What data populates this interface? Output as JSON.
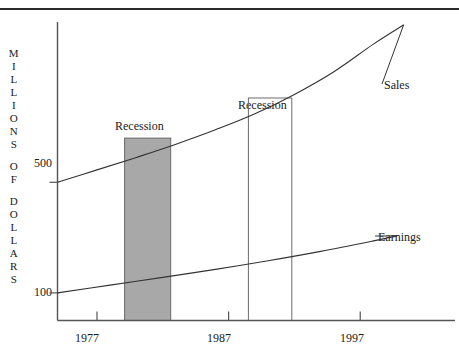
{
  "chart_data": {
    "type": "line",
    "title": "",
    "subtitle": "",
    "xlabel": "",
    "ylabel": "MILLIONS OF DOLLARS",
    "ylabel_letters": [
      "M",
      "I",
      "L",
      "L",
      "I",
      "O",
      "N",
      "S",
      "",
      "O",
      "F",
      "",
      "D",
      "O",
      "L",
      "L",
      "A",
      "R",
      "S"
    ],
    "grid": false,
    "legend_position": "inline-right-end-labels",
    "xlim": [
      1974.0,
      2004.2
    ],
    "ylim": [
      0,
      1080
    ],
    "x_ticks": [
      1977,
      1987,
      1997
    ],
    "x_tick_labels": [
      "1977",
      "1987",
      "1997"
    ],
    "y_ticks": [
      100,
      500
    ],
    "y_tick_labels": [
      "100",
      "500"
    ],
    "series": [
      {
        "name": "Sales",
        "label": "Sales",
        "color": "#333333",
        "x": [
          1974.0,
          1977.0,
          1980.0,
          1983.0,
          1986.0,
          1989.0,
          1992.0,
          1995.0,
          1998.0,
          2000.3
        ],
        "values": [
          500,
          545,
          590,
          638,
          690,
          748,
          818,
          900,
          1000,
          1070
        ]
      },
      {
        "name": "Earnings",
        "label": "Earnings",
        "color": "#333333",
        "x": [
          1974.0,
          1978.0,
          1982.0,
          1986.0,
          1990.0,
          1994.0,
          1998.0,
          1999.8
        ],
        "values": [
          100,
          128,
          156,
          185,
          216,
          250,
          288,
          306
        ]
      }
    ],
    "annotations": [
      {
        "label": "Recession",
        "kind": "shaded-band",
        "fill": "#a8a8a8",
        "stroke": "#6b6b6b",
        "x_start": 1979.1,
        "x_end": 1982.6,
        "y_top": 660,
        "y_bottom": 0
      },
      {
        "label": "Recession",
        "kind": "outline-band",
        "fill": "none",
        "stroke": "#6b6b6b",
        "x_start": 1988.5,
        "x_end": 1991.8,
        "y_top": 805,
        "y_bottom": 0
      }
    ],
    "colors": {
      "axis": "#555555",
      "line": "#333333",
      "recession_fill": "#a8a8a8",
      "recession_stroke": "#6b6b6b",
      "top_rule": "#2b2b2b",
      "text": "#1a1a1a"
    }
  }
}
